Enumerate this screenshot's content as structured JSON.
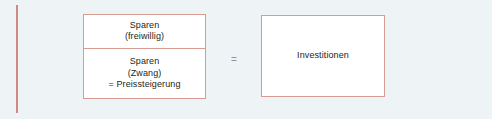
{
  "diagram": {
    "colors": {
      "background": "#eef4f5",
      "box_fill": "#ffffff",
      "box_border": "#d79b92",
      "margin_rule": "#d08a84",
      "text": "#231f20",
      "equals_sign": "#8a9699"
    },
    "savings_box": {
      "voluntary_cell": {
        "lines": [
          "Sparen",
          "(freiwillig)"
        ]
      },
      "forced_cell": {
        "lines": [
          "Sparen",
          "(Zwang)",
          "= Preissteigerung"
        ]
      }
    },
    "relation": {
      "symbol": "="
    },
    "investment_box": {
      "label": "Investitionen"
    }
  }
}
